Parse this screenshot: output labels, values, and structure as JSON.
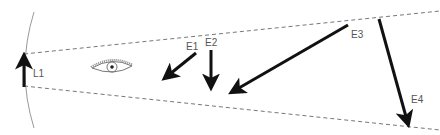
{
  "diagram": {
    "type": "optics-ray-diagram",
    "object": {
      "label": "L1",
      "x": 24,
      "y_top": 54,
      "y_bottom": 87
    },
    "eye": {
      "cx": 112,
      "cy": 68
    },
    "sight_lines": {
      "upper": {
        "x1": 24,
        "y1": 54,
        "x2": 440,
        "y2": 11
      },
      "lower": {
        "x1": 24,
        "y1": 86,
        "x2": 440,
        "y2": 130
      }
    },
    "arrows": [
      {
        "label": "E1",
        "x1": 196,
        "y1": 53,
        "x2": 165,
        "y2": 78,
        "label_x": 186,
        "label_y": 50
      },
      {
        "label": "E2",
        "x1": 211,
        "y1": 50,
        "x2": 211,
        "y2": 87,
        "label_x": 205,
        "label_y": 46
      },
      {
        "label": "E3",
        "x1": 348,
        "y1": 25,
        "x2": 232,
        "y2": 92,
        "label_x": 351,
        "label_y": 38
      },
      {
        "label": "E4",
        "x1": 379,
        "y1": 19,
        "x2": 408,
        "y2": 124,
        "label_x": 411,
        "label_y": 103
      }
    ],
    "colors": {
      "arrow": "#111111",
      "dashed_line": "#777777",
      "arc": "#999999",
      "label": "#555555"
    }
  }
}
